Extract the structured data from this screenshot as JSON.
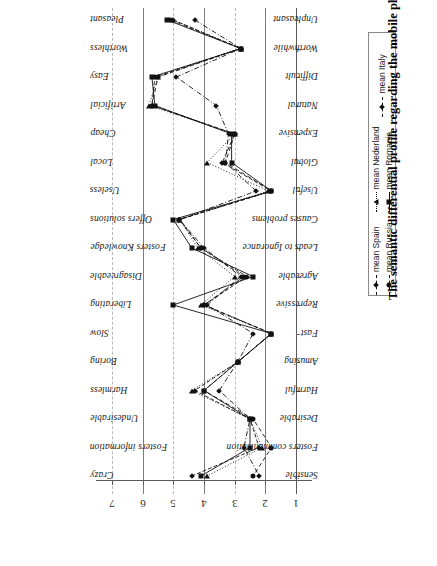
{
  "title": "The semantic differential profile regarding the mobile phone",
  "legend": {
    "entries": [
      {
        "label": "mean Spain",
        "marker": "diamond",
        "dash": "4,2"
      },
      {
        "label": "mean Nederland",
        "marker": "triangle",
        "dash": "1,2"
      },
      {
        "label": "mean Italy",
        "marker": "diamond",
        "dash": "5,2,1,2"
      },
      {
        "label": "mean Russia",
        "marker": "circle",
        "dash": "4,3"
      },
      {
        "label": "mean Romania",
        "marker": "square",
        "dash": "none"
      }
    ]
  },
  "chart_data": {
    "type": "line",
    "title": "The semantic differential profile regarding the mobile phone",
    "xlabel": "",
    "ylabel": "",
    "xlim": [
      7,
      1
    ],
    "grid": true,
    "legend_position": "right",
    "orientation": "horizontal-rotated",
    "axis_ticks": [
      7,
      6,
      5,
      4,
      3,
      2,
      1
    ],
    "categories_left": [
      "Pleasant",
      "Worthless",
      "Easy",
      "Artificial",
      "Cheap",
      "Local",
      "Useless",
      "Offers solutions",
      "Fosters Knowledge",
      "Disagreeable",
      "Liberating",
      "Slow",
      "Boring",
      "Harmless",
      "Undesirable",
      "Fosters information",
      "Crazy"
    ],
    "categories_right": [
      "Unpleasant",
      "Worthwhile",
      "Difficult",
      "Natural",
      "Expensive",
      "Global",
      "Useful",
      "Causes problems",
      "Leads to Ignorance",
      "Agreeable",
      "Repressive",
      "Fast",
      "Amusing",
      "Harmful",
      "Desirable",
      "Fosters communication",
      "Sensible"
    ],
    "series": [
      {
        "name": "mean Spain",
        "marker": "diamond",
        "values": [
          5.0,
          2.8,
          5.6,
          5.7,
          3.0,
          3.4,
          1.8,
          4.8,
          4.1,
          2.6,
          4.0,
          1.8,
          2.9,
          4.3,
          2.5,
          2.2,
          4.4
        ]
      },
      {
        "name": "mean Nederland",
        "marker": "triangle",
        "values": [
          5.0,
          2.8,
          5.5,
          5.8,
          3.0,
          3.9,
          1.9,
          4.8,
          4.2,
          3.0,
          4.1,
          1.8,
          2.9,
          4.4,
          2.5,
          2.1,
          3.9
        ]
      },
      {
        "name": "mean Italy",
        "marker": "diamond",
        "values": [
          4.3,
          2.8,
          4.9,
          3.6,
          3.2,
          3.3,
          2.3,
          4.8,
          4.0,
          2.8,
          3.9,
          2.4,
          2.9,
          3.5,
          2.5,
          2.7,
          2.2
        ]
      },
      {
        "name": "mean Russia",
        "marker": "circle",
        "values": [
          5.1,
          2.8,
          5.5,
          5.7,
          3.0,
          3.3,
          1.8,
          4.8,
          4.1,
          2.7,
          4.0,
          1.8,
          2.9,
          4.0,
          2.4,
          1.8,
          2.4
        ]
      },
      {
        "name": "mean Romania",
        "marker": "square",
        "values": [
          5.2,
          2.8,
          5.7,
          5.6,
          3.1,
          3.1,
          1.8,
          5.0,
          4.4,
          2.4,
          5.0,
          1.8,
          2.9,
          4.0,
          2.5,
          2.5,
          4.1
        ]
      }
    ]
  }
}
